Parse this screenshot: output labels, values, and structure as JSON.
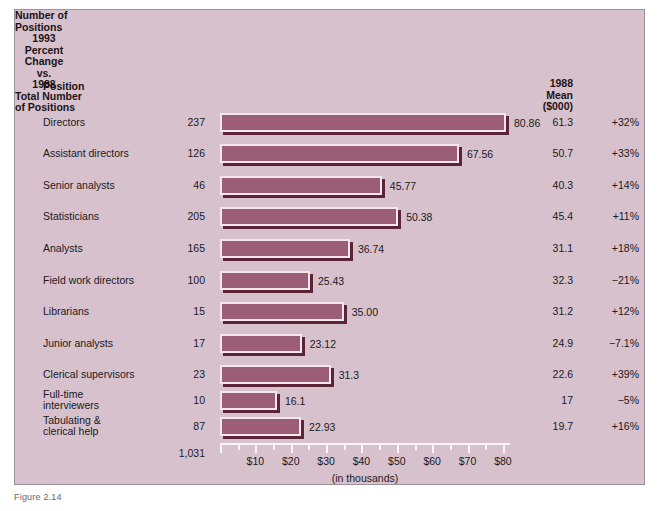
{
  "headers": {
    "position": "Position",
    "number_of_positions": "Number of\nPositions",
    "mean_1988": "1988 Mean\n($000)",
    "percent_change": "1993\nPercent\nChange\nvs.\n1988"
  },
  "total": {
    "label": "Total Number\nof Positions",
    "value": "1,031"
  },
  "axis": {
    "title": "(in thousands)",
    "ticks": [
      "$10",
      "$20",
      "$30",
      "$40",
      "$50",
      "$60",
      "$70",
      "$80"
    ]
  },
  "caption": "Figure 2.14",
  "colors": {
    "panel_background": "#d7c1cc",
    "bar_fill": "#9c5e76",
    "bar_highlight": "#f3e7ec",
    "bar_shadow": "#5c2537",
    "text": "#211a1e"
  },
  "chart_data": {
    "type": "bar",
    "orientation": "horizontal",
    "title": "",
    "xlabel": "(in thousands)",
    "ylabel": "Position",
    "xlim": [
      0,
      82
    ],
    "grid": false,
    "legend": "none",
    "tick_labels": [
      "$10",
      "$20",
      "$30",
      "$40",
      "$50",
      "$60",
      "$70",
      "$80"
    ],
    "tick_values": [
      10,
      20,
      30,
      40,
      50,
      60,
      70,
      80
    ],
    "minor_tick_step": 5,
    "categories": [
      "Directors",
      "Assistant directors",
      "Senior analysts",
      "Statisticians",
      "Analysts",
      "Field work directors",
      "Librarians",
      "Junior analysts",
      "Clerical supervisors",
      "Full-time\ninterviewers",
      "Tabulating &\nclerical help"
    ],
    "values": [
      80.86,
      67.56,
      45.77,
      50.38,
      36.74,
      25.43,
      35.0,
      23.12,
      31.3,
      16.1,
      22.93
    ],
    "value_labels": [
      "80.86",
      "67.56",
      "45.77",
      "50.38",
      "36.74",
      "25.43",
      "35.00",
      "23.12",
      "31.3",
      "16.1",
      "22.93"
    ],
    "series": [
      {
        "name": "1993 Mean ($000)",
        "values": [
          80.86,
          67.56,
          45.77,
          50.38,
          36.74,
          25.43,
          35.0,
          23.12,
          31.3,
          16.1,
          22.93
        ]
      }
    ],
    "rows": [
      {
        "position": "Directors",
        "number_of_positions": "237",
        "bar_value": "80.86",
        "mean_1988": "61.3",
        "percent_change": "+32%"
      },
      {
        "position": "Assistant directors",
        "number_of_positions": "126",
        "bar_value": "67.56",
        "mean_1988": "50.7",
        "percent_change": "+33%"
      },
      {
        "position": "Senior analysts",
        "number_of_positions": "46",
        "bar_value": "45.77",
        "mean_1988": "40.3",
        "percent_change": "+14%"
      },
      {
        "position": "Statisticians",
        "number_of_positions": "205",
        "bar_value": "50.38",
        "mean_1988": "45.4",
        "percent_change": "+11%"
      },
      {
        "position": "Analysts",
        "number_of_positions": "165",
        "bar_value": "36.74",
        "mean_1988": "31.1",
        "percent_change": "+18%"
      },
      {
        "position": "Field work directors",
        "number_of_positions": "100",
        "bar_value": "25.43",
        "mean_1988": "32.3",
        "percent_change": "−21%"
      },
      {
        "position": "Librarians",
        "number_of_positions": "15",
        "bar_value": "35.00",
        "mean_1988": "31.2",
        "percent_change": "+12%"
      },
      {
        "position": "Junior analysts",
        "number_of_positions": "17",
        "bar_value": "23.12",
        "mean_1988": "24.9",
        "percent_change": "−7.1%"
      },
      {
        "position": "Clerical supervisors",
        "number_of_positions": "23",
        "bar_value": "31.3",
        "mean_1988": "22.6",
        "percent_change": "+39%"
      },
      {
        "position": "Full-time\ninterviewers",
        "number_of_positions": "10",
        "bar_value": "16.1",
        "mean_1988": "17",
        "percent_change": "−5%"
      },
      {
        "position": "Tabulating &\nclerical help",
        "number_of_positions": "87",
        "bar_value": "22.93",
        "mean_1988": "19.7",
        "percent_change": "+16%"
      }
    ]
  }
}
